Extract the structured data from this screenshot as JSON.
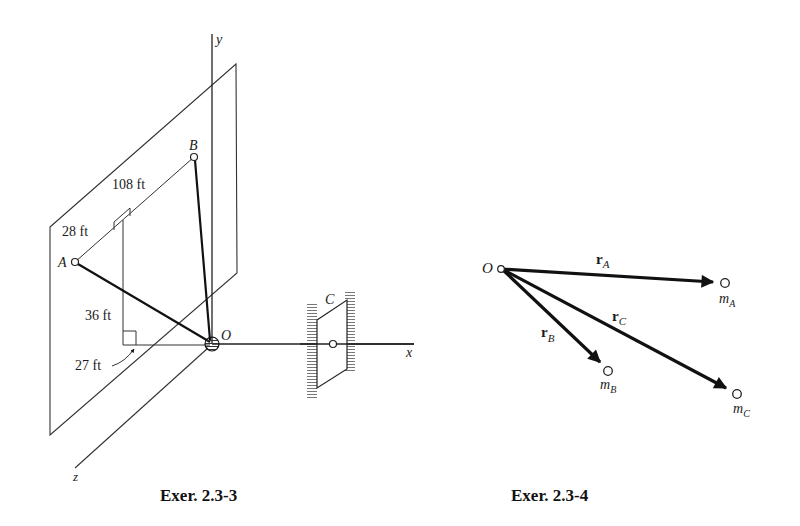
{
  "figures": [
    {
      "id": "left",
      "caption": "Exer. 2.3-3",
      "axes": {
        "x": "x",
        "y": "y",
        "z": "z"
      },
      "points": {
        "origin": "O",
        "A": "A",
        "B": "B",
        "C": "C"
      },
      "dimensions": {
        "ab": "108 ft",
        "a_offset": "28 ft",
        "height": "36 ft",
        "depth": "27 ft"
      }
    },
    {
      "id": "right",
      "caption": "Exer. 2.3-4",
      "origin": "O",
      "vectors": [
        {
          "label": "r",
          "sub": "A",
          "mass": "m",
          "mass_sub": "A"
        },
        {
          "label": "r",
          "sub": "B",
          "mass": "m",
          "mass_sub": "B"
        },
        {
          "label": "r",
          "sub": "C",
          "mass": "m",
          "mass_sub": "C"
        }
      ]
    }
  ],
  "colors": {
    "ink": "#1a1a1a",
    "background": "#ffffff"
  }
}
